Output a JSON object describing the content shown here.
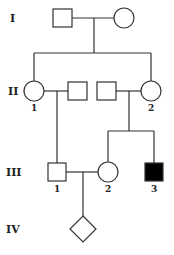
{
  "pedigree": {
    "generations": [
      {
        "label": "I",
        "y": 18
      },
      {
        "label": "II",
        "y": 91
      },
      {
        "label": "III",
        "y": 172
      },
      {
        "label": "IV",
        "y": 229
      }
    ],
    "individuals": {
      "I_1": {
        "sex": "male",
        "affected": false,
        "label": ""
      },
      "I_2": {
        "sex": "female",
        "affected": false,
        "label": ""
      },
      "II_1": {
        "sex": "female",
        "affected": false,
        "label": "1"
      },
      "II_1_spouse": {
        "sex": "male",
        "affected": false,
        "label": ""
      },
      "II_2_spouse": {
        "sex": "male",
        "affected": false,
        "label": ""
      },
      "II_2": {
        "sex": "female",
        "affected": false,
        "label": "2"
      },
      "III_1": {
        "sex": "male",
        "affected": false,
        "label": "1"
      },
      "III_2": {
        "sex": "female",
        "affected": false,
        "label": "2"
      },
      "III_3": {
        "sex": "male",
        "affected": true,
        "label": "3"
      },
      "IV_1": {
        "sex": "unknown",
        "affected": false,
        "label": ""
      }
    },
    "colors": {
      "line": "#333333",
      "affected_fill": "#000000",
      "unaffected_fill": "#ffffff"
    }
  }
}
